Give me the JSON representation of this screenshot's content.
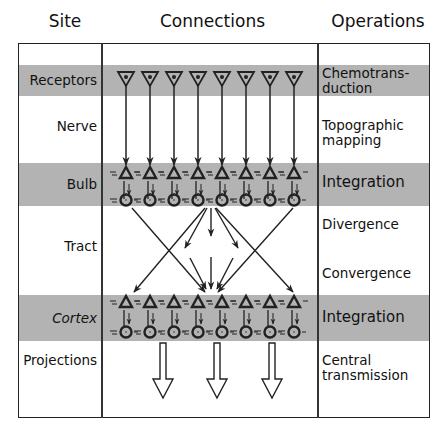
{
  "headers": {
    "site": "Site",
    "connections": "Connections",
    "operations": "Operations"
  },
  "rows": [
    {
      "site": "Receptors",
      "operation": "Chemotrans-\nduction",
      "shaded": true
    },
    {
      "site": "Nerve",
      "operation": "Topographic mapping",
      "shaded": false
    },
    {
      "site": "Bulb",
      "operation": "Integration",
      "shaded": true
    },
    {
      "site": "Tract",
      "operation": "Divergence",
      "operation_2": "Convergence",
      "shaded": false
    },
    {
      "site": "Cortex",
      "operation": "Integration",
      "shaded": true
    },
    {
      "site": "Projections",
      "operation": "Central transmission",
      "shaded": false
    }
  ],
  "labels": {
    "receptors": "Receptors",
    "nerve": "Nerve",
    "bulb": "Bulb",
    "tract": "Tract",
    "cortex": "Cortex",
    "projections": "Projections",
    "op_chemo_1": "Chemotrans-",
    "op_chemo_2": "duction",
    "op_topo_1": "Topographic",
    "op_topo_2": "mapping",
    "op_bulb": "Integration",
    "op_divergence": "Divergence",
    "op_convergence": "Convergence",
    "op_cortex": "Integration",
    "op_central_1": "Central",
    "op_central_2": "transmission"
  },
  "icons": {
    "receptor": "inverted-triangle-with-dot",
    "mitral_cell": "triangle",
    "granule_cell": "circle",
    "projection": "hollow-down-arrow"
  },
  "colors": {
    "band": "#b3b3b3",
    "line": "#222222",
    "background": "#ffffff"
  },
  "diagram": {
    "receptor_count": 8,
    "column_x": [
      126,
      150,
      174,
      198,
      222,
      246,
      270,
      294
    ],
    "projection_arrows_x": [
      163,
      217,
      272
    ]
  }
}
